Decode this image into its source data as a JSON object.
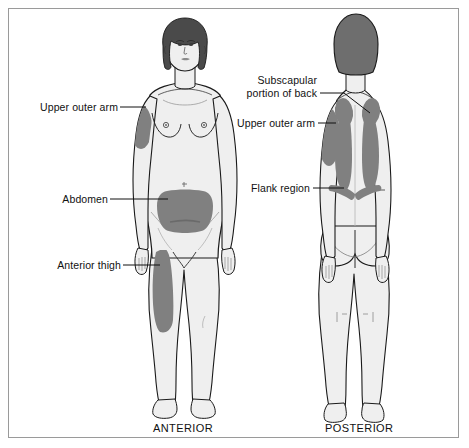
{
  "figure": {
    "view_captions": {
      "anterior": "ANTERIOR",
      "posterior": "POSTERIOR"
    },
    "colors": {
      "highlight_region": "#808080",
      "body_fill": "#efefef",
      "body_shade": "#e0e0e0",
      "outline": "#1a1a1a",
      "hair": "#4a4a4a",
      "hair_posterior": "#6e6e6e",
      "frame": "#9a9a9a",
      "background": "#ffffff",
      "label_text": "#111111"
    },
    "anterior_labels": [
      {
        "id": "upper-outer-arm",
        "text": "Upper outer arm"
      },
      {
        "id": "abdomen",
        "text": "Abdomen"
      },
      {
        "id": "anterior-thigh",
        "text": "Anterior thigh"
      }
    ],
    "posterior_labels": [
      {
        "id": "subscapular",
        "line1": "Subscapular",
        "line2": "portion of back"
      },
      {
        "id": "upper-outer-arm-post",
        "text": "Upper outer arm"
      },
      {
        "id": "flank-region",
        "text": "Flank region"
      }
    ],
    "highlighted_regions": {
      "anterior": [
        "Upper outer arm",
        "Abdomen",
        "Anterior thigh"
      ],
      "posterior": [
        "Subscapular portion of back",
        "Upper outer arm",
        "Flank region"
      ]
    }
  }
}
